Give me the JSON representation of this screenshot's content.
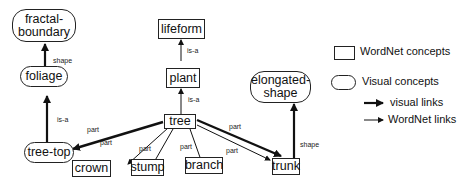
{
  "diagram": {
    "nodes": {
      "fractal_boundary": {
        "label": "fractal-\nboundary",
        "line1": "fractal-",
        "line2": "boundary",
        "type": "visual"
      },
      "foliage": {
        "label": "foliage",
        "type": "visual"
      },
      "tree_top": {
        "label": "tree-top",
        "type": "visual"
      },
      "lifeform": {
        "label": "lifeform",
        "type": "wordnet"
      },
      "plant": {
        "label": "plant",
        "type": "wordnet"
      },
      "tree": {
        "label": "tree",
        "type": "wordnet"
      },
      "crown": {
        "label": "crown",
        "type": "wordnet"
      },
      "stump": {
        "label": "stump",
        "type": "wordnet"
      },
      "branch": {
        "label": "branch",
        "type": "wordnet"
      },
      "trunk": {
        "label": "trunk",
        "type": "wordnet"
      },
      "elongated_shape": {
        "label": "elongated-\nshape",
        "line1": "elongated-",
        "line2": "shape",
        "type": "visual"
      }
    },
    "edges": [
      {
        "from": "foliage",
        "to": "fractal_boundary",
        "label": "shape",
        "kind": "visual"
      },
      {
        "from": "tree_top",
        "to": "foliage",
        "label": "is-a",
        "kind": "visual"
      },
      {
        "from": "plant",
        "to": "lifeform",
        "label": "is-a",
        "kind": "wordnet"
      },
      {
        "from": "tree",
        "to": "plant",
        "label": "is-a",
        "kind": "wordnet"
      },
      {
        "from": "tree",
        "to": "tree_top",
        "label": "part",
        "kind": "visual"
      },
      {
        "from": "tree",
        "to": "crown",
        "label": "part",
        "kind": "wordnet"
      },
      {
        "from": "tree",
        "to": "stump",
        "label": "part",
        "kind": "wordnet"
      },
      {
        "from": "tree",
        "to": "branch",
        "label": "part",
        "kind": "wordnet"
      },
      {
        "from": "tree",
        "to": "trunk",
        "label": "part",
        "kind": "visual"
      },
      {
        "from": "tree",
        "to": "trunk",
        "label": "part",
        "kind": "wordnet"
      },
      {
        "from": "trunk",
        "to": "elongated_shape",
        "label": "shape",
        "kind": "visual"
      }
    ],
    "edge_labels": {
      "shape_fractal": "shape",
      "isa_foliage": "is-a",
      "isa_lifeform": "is-a",
      "isa_plant": "is-a",
      "part_treetop": "part",
      "part_crown": "part",
      "part_stump": "part",
      "part_branch": "part",
      "part_trunk_visual": "part",
      "part_trunk_wordnet": "part",
      "shape_elongated": "shape"
    }
  },
  "legend": {
    "wordnet_concepts": "WordNet concepts",
    "visual_concepts": "Visual concepts",
    "visual_links": "visual links",
    "wordnet_links": "WordNet links"
  }
}
